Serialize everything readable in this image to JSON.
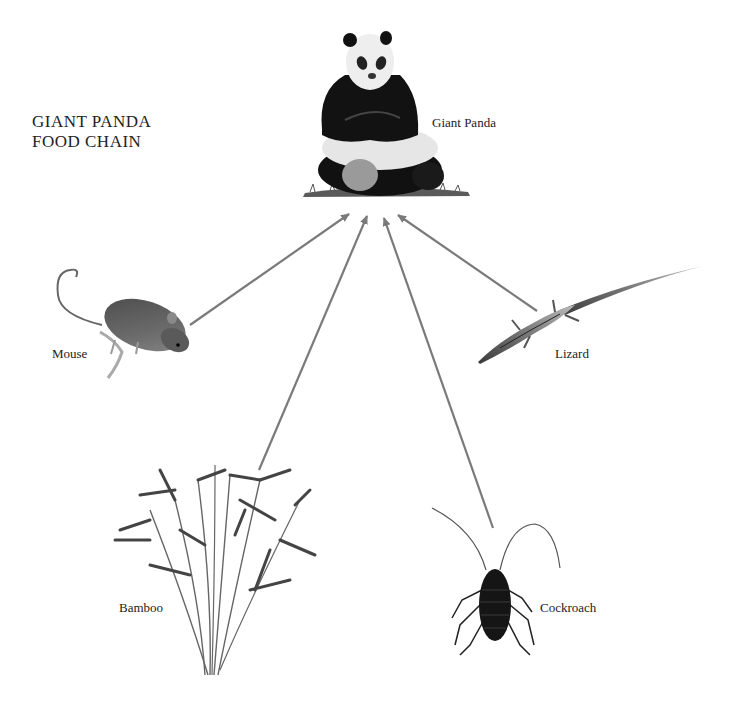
{
  "title": {
    "line1": "GIANT PANDA",
    "line2": "FOOD CHAIN"
  },
  "organisms": [
    {
      "id": "giant-panda",
      "label": "Giant Panda",
      "role": "consumer",
      "icon": "panda-illustration"
    },
    {
      "id": "mouse",
      "label": "Mouse",
      "role": "food",
      "icon": "mouse-illustration"
    },
    {
      "id": "lizard",
      "label": "Lizard",
      "role": "food",
      "icon": "lizard-illustration"
    },
    {
      "id": "bamboo",
      "label": "Bamboo",
      "role": "food",
      "icon": "bamboo-illustration"
    },
    {
      "id": "cockroach",
      "label": "Cockroach",
      "role": "food",
      "icon": "cockroach-illustration"
    }
  ],
  "arrows": [
    {
      "from": "mouse",
      "to": "giant-panda"
    },
    {
      "from": "bamboo",
      "to": "giant-panda"
    },
    {
      "from": "cockroach",
      "to": "giant-panda"
    },
    {
      "from": "lizard",
      "to": "giant-panda"
    }
  ],
  "colors": {
    "arrow": "#7a7a7a",
    "background": "#ffffff",
    "text": "#222222"
  }
}
